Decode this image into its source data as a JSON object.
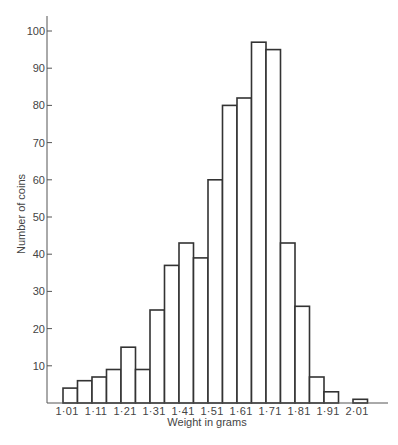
{
  "chart_data": {
    "type": "bar",
    "subtype": "histogram",
    "title": "",
    "xlabel": "Weight in grams",
    "ylabel": "Number of coins",
    "bin_width": 0.05,
    "bins_start": [
      1.01,
      1.06,
      1.11,
      1.16,
      1.21,
      1.26,
      1.31,
      1.36,
      1.41,
      1.46,
      1.51,
      1.56,
      1.61,
      1.66,
      1.71,
      1.76,
      1.81,
      1.86,
      1.91,
      1.96,
      2.01
    ],
    "values": [
      4,
      6,
      7,
      9,
      15,
      9,
      25,
      37,
      43,
      39,
      60,
      80,
      82,
      97,
      95,
      43,
      26,
      7,
      3,
      0,
      1
    ],
    "x_tick_labels": [
      "1·01",
      "1·11",
      "1·21",
      "1·31",
      "1·41",
      "1·51",
      "1·61",
      "1·71",
      "1·81",
      "1·91",
      "2·01"
    ],
    "y_ticks": [
      10,
      20,
      30,
      40,
      50,
      60,
      70,
      80,
      90,
      100
    ],
    "y_tick_labels": [
      "10",
      "20",
      "30",
      "40",
      "50",
      "60",
      "70",
      "80",
      "90",
      "100"
    ],
    "ylim": [
      0,
      104
    ],
    "grid": false,
    "legend": null
  }
}
